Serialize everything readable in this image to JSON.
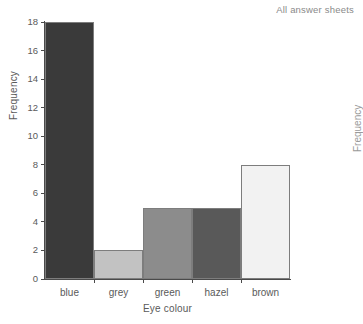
{
  "header": {
    "title": "All answer sheets"
  },
  "neighbor_chart": {
    "ylabel": "Frequency"
  },
  "chart_data": {
    "type": "bar",
    "title": "",
    "subtitle": "",
    "xlabel": "Eye colour",
    "ylabel": "Frequency",
    "categories": [
      "blue",
      "grey",
      "green",
      "hazel",
      "brown"
    ],
    "values": [
      18,
      2,
      5,
      5,
      8
    ],
    "ylim": [
      0,
      18
    ],
    "xlim": [
      0,
      5
    ],
    "yticks": [
      0,
      2,
      4,
      6,
      8,
      10,
      12,
      14,
      16,
      18
    ],
    "ytick_labels": [
      "0",
      "2",
      "4",
      "6",
      "8",
      "10",
      "12",
      "14",
      "16",
      "18"
    ],
    "grid": false,
    "legend": false,
    "legend_position": "none",
    "bar_gap": 0,
    "bar_colors": [
      "#3a3a3a",
      "#c2c2c2",
      "#8c8c8c",
      "#595959",
      "#f2f2f2"
    ],
    "bar_border_color": "#7d7d7d",
    "axis_color": "#4a4a4a",
    "text_color": "#5a5a5a",
    "background": "#ffffff"
  }
}
